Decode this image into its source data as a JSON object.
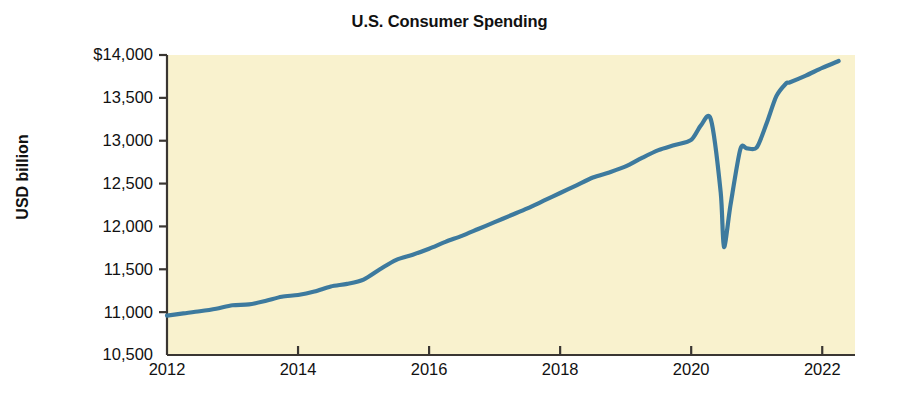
{
  "chart_data": {
    "type": "line",
    "title": "U.S. Consumer Spending",
    "xlabel": "",
    "ylabel": "USD billion",
    "grid": false,
    "legend": false,
    "legend_position": "none",
    "xlim": [
      2012.0,
      2022.5
    ],
    "ylim": [
      10500,
      14000
    ],
    "xticks": [
      2012,
      2014,
      2016,
      2018,
      2020,
      2022
    ],
    "xtick_labels": [
      "2012",
      "2014",
      "2016",
      "2018",
      "2020",
      "2022"
    ],
    "yticks": [
      10500,
      11000,
      11500,
      12000,
      12500,
      13000,
      13500,
      14000
    ],
    "ytick_labels": [
      "10,500",
      "11,000",
      "11,500",
      "12,000",
      "12,500",
      "13,000",
      "13,500",
      "$14,000"
    ],
    "series": [
      {
        "name": "U.S. Consumer Spending",
        "color": "#3d7a9e",
        "x": [
          2012.0,
          2012.25,
          2012.5,
          2012.75,
          2013.0,
          2013.25,
          2013.5,
          2013.75,
          2014.0,
          2014.25,
          2014.5,
          2014.75,
          2015.0,
          2015.25,
          2015.5,
          2015.75,
          2016.0,
          2016.25,
          2016.5,
          2016.75,
          2017.0,
          2017.25,
          2017.5,
          2017.75,
          2018.0,
          2018.25,
          2018.5,
          2018.75,
          2019.0,
          2019.25,
          2019.5,
          2019.75,
          2020.0,
          2020.15,
          2020.3,
          2020.45,
          2020.5,
          2020.6,
          2020.75,
          2020.85,
          2021.0,
          2021.15,
          2021.3,
          2021.45,
          2021.5,
          2021.75,
          2022.0,
          2022.25
        ],
        "y": [
          10960,
          10985,
          11010,
          11040,
          11080,
          11090,
          11130,
          11180,
          11200,
          11240,
          11300,
          11330,
          11380,
          11500,
          11610,
          11670,
          11740,
          11820,
          11890,
          11970,
          12050,
          12130,
          12210,
          12300,
          12390,
          12480,
          12570,
          12630,
          12700,
          12800,
          12890,
          12950,
          13010,
          13180,
          13250,
          12400,
          11760,
          12250,
          12900,
          12910,
          12920,
          13200,
          13520,
          13670,
          13680,
          13760,
          13850,
          13930
        ]
      }
    ],
    "annotations": {
      "peak_value": 13250,
      "peak_x": 2020.3,
      "trough_value": 11760,
      "trough_x": 2020.5,
      "start_value": 10960,
      "end_value": 13930
    },
    "colors": {
      "plot_background": "#f9f2ce",
      "line": "#3d7a9e",
      "axis": "#3a3632",
      "text": "#111111",
      "figure_background": "#ffffff"
    }
  }
}
